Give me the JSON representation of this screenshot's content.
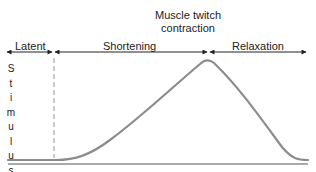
{
  "title": {
    "line1": "Muscle twitch",
    "line2": "contraction"
  },
  "phases": [
    {
      "label": "Latent"
    },
    {
      "label": "Shortening"
    },
    {
      "label": "Relaxation"
    }
  ],
  "stimulus_label": [
    "S",
    "t",
    "i",
    "m",
    "u",
    "l",
    "u",
    "s"
  ],
  "colors": {
    "curve": "#8c8c8c",
    "arrow": "#222222",
    "dashed_marker": "#999999",
    "baseline": "#555555"
  }
}
